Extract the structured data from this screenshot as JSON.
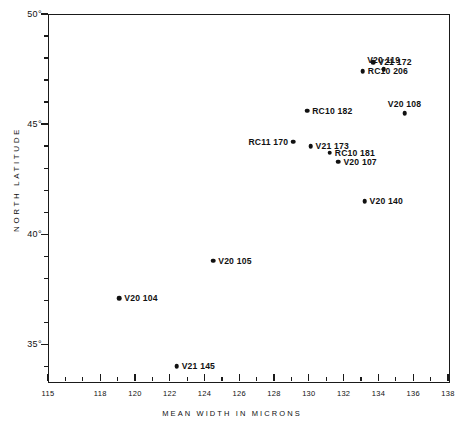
{
  "chart_data": {
    "type": "scatter",
    "title": "",
    "xlabel": "MEAN WIDTH IN MICRONS",
    "ylabel": "NORTH LATITUDE",
    "xlim": [
      115,
      138
    ],
    "ylim": [
      33.33,
      50
    ],
    "grid": false,
    "legend": "none",
    "xticks_major": [
      115,
      118,
      120,
      122,
      124,
      126,
      128,
      130,
      132,
      134,
      136,
      138
    ],
    "xtick_labels": [
      "115",
      "118",
      "120",
      "122",
      "124",
      "126",
      "128",
      "130",
      "132",
      "134",
      "136",
      "138"
    ],
    "xticks_minor": [
      116,
      117,
      119,
      121,
      123,
      125,
      127,
      129,
      131,
      133,
      135,
      137
    ],
    "yticks_major": [
      50,
      45,
      40,
      35
    ],
    "ytick_labels": [
      "50°",
      "45°",
      "40°",
      "35°"
    ],
    "yticks_minor": [
      49,
      48,
      47,
      46,
      44,
      43,
      42,
      41,
      39,
      38,
      37,
      36,
      34
    ],
    "points": [
      {
        "label": "V20 119",
        "x": 134.3,
        "y": 47.5,
        "label_pos": "above"
      },
      {
        "label": "V21 172",
        "x": 133.7,
        "y": 47.8,
        "label_pos": "right"
      },
      {
        "label": "RC10 206",
        "x": 133.1,
        "y": 47.4,
        "label_pos": "right"
      },
      {
        "label": "RC10 182",
        "x": 129.9,
        "y": 45.6,
        "label_pos": "right"
      },
      {
        "label": "V20 108",
        "x": 135.5,
        "y": 45.5,
        "label_pos": "above"
      },
      {
        "label": "RC11 170",
        "x": 129.1,
        "y": 44.2,
        "label_pos": "left"
      },
      {
        "label": "V21 173",
        "x": 130.1,
        "y": 44.0,
        "label_pos": "right"
      },
      {
        "label": "RC10 181",
        "x": 131.2,
        "y": 43.7,
        "label_pos": "right"
      },
      {
        "label": "V20 107",
        "x": 131.7,
        "y": 43.3,
        "label_pos": "right"
      },
      {
        "label": "V20 140",
        "x": 133.2,
        "y": 41.5,
        "label_pos": "right"
      },
      {
        "label": "V20 105",
        "x": 124.5,
        "y": 38.8,
        "label_pos": "right"
      },
      {
        "label": "V20 104",
        "x": 119.1,
        "y": 37.1,
        "label_pos": "right"
      },
      {
        "label": "V21 145",
        "x": 122.4,
        "y": 34.0,
        "label_pos": "right"
      }
    ],
    "colors": {
      "marker": "#111111",
      "axis": "#1a1a1a",
      "background": "#ffffff"
    }
  }
}
